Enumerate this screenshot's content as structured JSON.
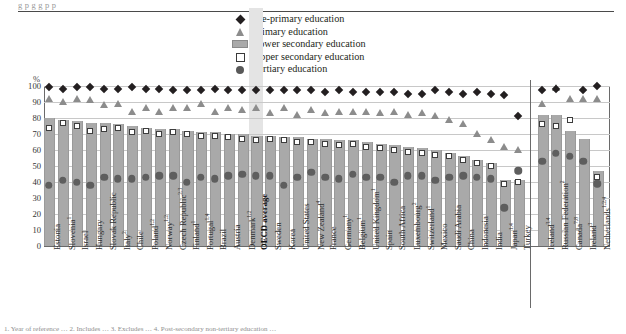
{
  "top_cropped_text": "g p  g  g  p p",
  "axis": {
    "unit_label": "%",
    "yticks": [
      0,
      10,
      20,
      30,
      40,
      50,
      60,
      70,
      80,
      90,
      100
    ],
    "ylim": [
      0,
      100
    ]
  },
  "legend": {
    "position": "top-center",
    "items": [
      {
        "icon": "diamond-marker",
        "label": "Pre-primary education",
        "color": "#231f20"
      },
      {
        "icon": "triangle-marker",
        "label": "Primary education",
        "color": "#8c8c8c"
      },
      {
        "icon": "bar-swatch",
        "label": "Lower secondary education",
        "color": "#a9a9a9"
      },
      {
        "icon": "open-square-marker",
        "label": "Upper secondary education",
        "color": "#ffffff"
      },
      {
        "icon": "circle-marker",
        "label": "Tertiary education",
        "color": "#5e5e5e"
      }
    ]
  },
  "footnote": "1. Year of reference … 2. Includes … 3. Excludes … 4. Post-secondary non-tertiary education …",
  "highlight": {
    "category": "OECD average",
    "color": "#e4e4e4"
  },
  "chart_data": {
    "type": "bar",
    "title": "",
    "subtitle": "",
    "xlabel": "",
    "ylabel": "%",
    "ylim": [
      0,
      100
    ],
    "grid": true,
    "legend_position": "top-center",
    "categories": [
      "Estonia",
      "Slovenia",
      "Israel",
      "Hungary",
      "Slovak Republic",
      "Italy",
      "Chile",
      "Poland",
      "Norway",
      "Czech Republic",
      "Finland",
      "Portugal",
      "Brazil",
      "Austria",
      "Denmark",
      "OECD average",
      "Sweden",
      "Korea",
      "United States",
      "New Zealand",
      "France",
      "Germany",
      "Belgium",
      "United Kingdom",
      "Spain",
      "South Africa",
      "Luxembourg",
      "Switzerland",
      "Mexico",
      "Saudi Arabia",
      "China",
      "Indonesia",
      "India",
      "Japan",
      "Turkey",
      "Iceland",
      "Russian Federation",
      "Canada",
      "Ireland",
      "Netherlands"
    ],
    "category_superscripts": [
      "",
      "1",
      "",
      "",
      "",
      "2",
      "",
      "1,2",
      "1,2",
      "2,3",
      "1",
      "1,4",
      "",
      "",
      "1,2",
      "",
      "",
      "",
      "",
      "4",
      "",
      "1",
      "1",
      "1",
      "",
      "",
      "2",
      "1",
      "",
      "",
      "",
      "",
      "",
      "1,4",
      "",
      "3,4",
      "2",
      "7,8",
      "3",
      "1,2,4"
    ],
    "panel_break_after": "Turkey",
    "series": [
      {
        "name": "Lower secondary education",
        "key": "lower_secondary",
        "marker": "bar",
        "values": [
          80,
          79,
          78,
          77,
          77,
          76,
          75,
          74,
          73,
          73,
          72,
          71,
          71,
          70,
          70,
          69,
          69,
          68,
          68,
          67,
          67,
          66,
          66,
          65,
          64,
          63,
          62,
          61,
          60,
          58,
          56,
          54,
          52,
          41,
          41,
          82,
          82,
          72,
          67,
          47
        ]
      },
      {
        "name": "Upper secondary education",
        "key": "upper_secondary",
        "marker": "open-square",
        "values": [
          74,
          77,
          75,
          72,
          73,
          74,
          71,
          72,
          70,
          71,
          70,
          69,
          69,
          68,
          67,
          66,
          67,
          66,
          65,
          65,
          64,
          63,
          64,
          62,
          61,
          60,
          59,
          58,
          57,
          56,
          54,
          52,
          50,
          39,
          40,
          76,
          75,
          79,
          null,
          43
        ]
      },
      {
        "name": "Tertiary education",
        "key": "tertiary",
        "marker": "circle",
        "values": [
          38,
          41,
          40,
          38,
          43,
          42,
          42,
          43,
          44,
          44,
          40,
          43,
          42,
          44,
          45,
          44,
          44,
          38,
          43,
          46,
          43,
          42,
          45,
          43,
          43,
          40,
          44,
          44,
          41,
          43,
          44,
          43,
          42,
          24,
          47,
          53,
          58,
          56,
          53,
          39
        ]
      },
      {
        "name": "Primary education",
        "key": "primary",
        "marker": "triangle",
        "values": [
          92,
          90,
          92,
          91,
          88,
          89,
          84,
          86,
          84,
          86,
          86,
          89,
          84,
          86,
          85,
          86,
          83,
          86,
          82,
          85,
          83,
          84,
          84,
          84,
          83,
          84,
          82,
          83,
          81,
          79,
          76,
          70,
          66,
          62,
          60,
          89,
          99,
          92,
          92,
          92
        ]
      },
      {
        "name": "Pre-primary education",
        "key": "pre_primary",
        "marker": "diamond",
        "values": [
          99,
          98,
          99,
          99,
          98,
          98,
          99,
          98,
          98,
          97,
          97,
          97,
          98,
          97,
          97,
          97,
          97,
          97,
          97,
          97,
          96,
          97,
          96,
          96,
          96,
          96,
          95,
          95,
          97,
          96,
          95,
          96,
          95,
          94,
          81,
          97,
          98,
          null,
          97,
          100
        ]
      }
    ]
  }
}
